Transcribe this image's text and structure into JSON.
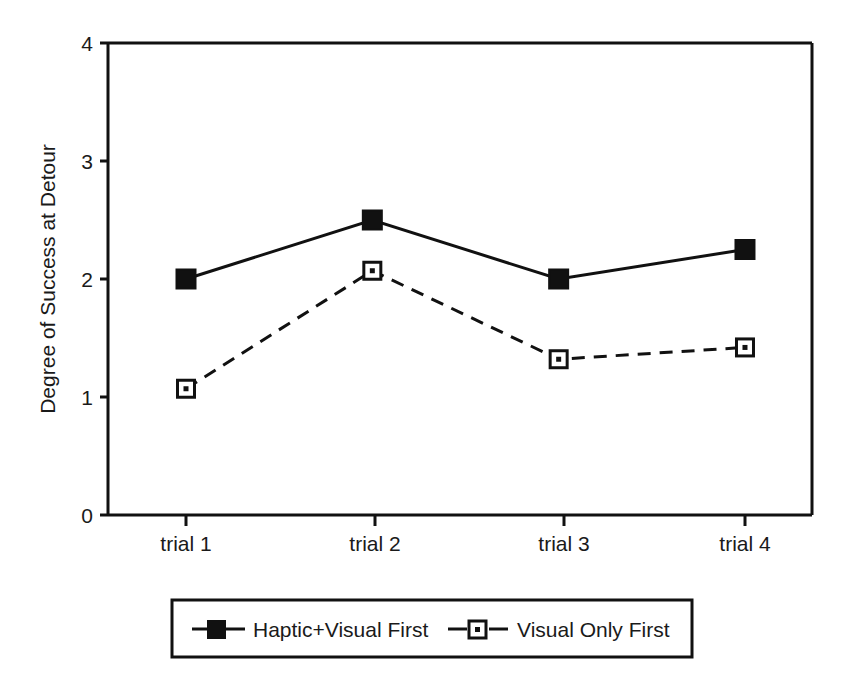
{
  "chart_data": {
    "type": "line",
    "title": "",
    "xlabel": "",
    "ylabel": "Degree of Success at Detour",
    "categories": [
      "trial 1",
      "trial 2",
      "trial 3",
      "trial 4"
    ],
    "ylim": [
      0,
      4
    ],
    "yticks": [
      "0",
      "1",
      "2",
      "3",
      "4"
    ],
    "ytick_values": [
      0,
      1,
      2,
      3,
      4
    ],
    "grid": false,
    "legend_position": "below-plot",
    "series": [
      {
        "name": "Haptic+Visual First",
        "values": [
          2.0,
          2.5,
          2.0,
          2.25
        ],
        "marker": "filled-square",
        "line_style": "solid",
        "color": "#000000"
      },
      {
        "name": "Visual Only First",
        "values": [
          1.07,
          2.07,
          1.32,
          1.42
        ],
        "marker": "open-square",
        "line_style": "dashed",
        "color": "#000000"
      }
    ]
  },
  "axes": {
    "y_axis_title": "Degree of Success at Detour",
    "y_tick_labels": [
      "4",
      "3",
      "2",
      "1",
      "0"
    ],
    "x_tick_labels": [
      "trial 1",
      "trial 2",
      "trial 3",
      "trial 4"
    ]
  },
  "legend": {
    "entries": [
      {
        "label": "Haptic+Visual First",
        "marker": "filled-square",
        "line_style": "solid"
      },
      {
        "label": "Visual Only First",
        "marker": "open-square",
        "line_style": "dashed"
      }
    ]
  },
  "colors": {
    "ink": "#111111",
    "background": "#ffffff"
  }
}
